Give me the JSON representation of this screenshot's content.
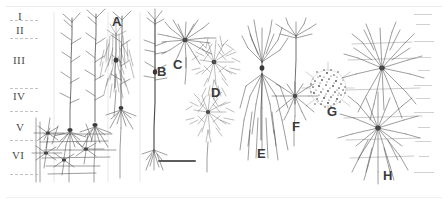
{
  "figure": {
    "background_color": "#ffffff",
    "ink_color": "#4d4d4d",
    "width": 448,
    "height": 205
  },
  "layers": {
    "axis_name": "cortical-layers",
    "items": [
      {
        "label": "I",
        "x": 18,
        "y": 16,
        "size": 11
      },
      {
        "label": "II",
        "x": 17,
        "y": 30,
        "size": 11
      },
      {
        "label": "III",
        "x": 14,
        "y": 60,
        "size": 11
      },
      {
        "label": "IV",
        "x": 14,
        "y": 96,
        "size": 11
      },
      {
        "label": "V",
        "x": 16,
        "y": 127,
        "size": 11
      },
      {
        "label": "VI",
        "x": 13,
        "y": 155,
        "size": 11
      }
    ],
    "boundaries": [
      {
        "y": 20,
        "x": 10,
        "width": 28
      },
      {
        "y": 38,
        "x": 10,
        "width": 28
      },
      {
        "y": 88,
        "x": 10,
        "width": 28
      },
      {
        "y": 111,
        "x": 10,
        "width": 28
      },
      {
        "y": 140,
        "x": 10,
        "width": 28
      },
      {
        "y": 174,
        "x": 10,
        "width": 28
      }
    ]
  },
  "panels": [
    {
      "id": "A",
      "label": "A",
      "x": 112,
      "y": 14,
      "size": 13,
      "description": "pyramidal cell with dense basal arbor"
    },
    {
      "id": "B",
      "label": "B",
      "x": 157,
      "y": 64,
      "size": 13,
      "description": "tall pyramidal cell with long descending axon"
    },
    {
      "id": "C",
      "label": "C",
      "x": 173,
      "y": 57,
      "size": 13,
      "description": "stellate / spiny cell"
    },
    {
      "id": "D",
      "label": "D",
      "x": 211,
      "y": 85,
      "size": 13,
      "description": "dense bushy interneuron"
    },
    {
      "id": "E",
      "label": "E",
      "x": 257,
      "y": 146,
      "size": 13,
      "description": "bitufted cell with long vertical processes"
    },
    {
      "id": "F",
      "label": "F",
      "x": 292,
      "y": 119,
      "size": 13,
      "description": "double bouquet cell"
    },
    {
      "id": "G",
      "label": "G",
      "x": 327,
      "y": 104,
      "size": 13,
      "description": "neurogliaform / dense spherical cell"
    },
    {
      "id": "H",
      "label": "H",
      "x": 383,
      "y": 168,
      "size": 13,
      "description": "paired multipolar basket cells"
    }
  ],
  "scale_bar": {
    "name": "scale-bar",
    "x": 158,
    "y": 160,
    "width": 38,
    "height": 2,
    "label": ""
  },
  "ruler_ticks": {
    "name": "right-margin-ticks",
    "x": 414,
    "items": [
      {
        "y": 14,
        "width": 18
      },
      {
        "y": 24,
        "width": 14
      },
      {
        "y": 41,
        "width": 20
      },
      {
        "y": 57,
        "width": 16
      },
      {
        "y": 70,
        "width": 12
      },
      {
        "y": 85,
        "width": 18
      },
      {
        "y": 98,
        "width": 14
      },
      {
        "y": 112,
        "width": 20
      },
      {
        "y": 127,
        "width": 12
      },
      {
        "y": 141,
        "width": 16
      },
      {
        "y": 156,
        "width": 10
      },
      {
        "y": 172,
        "width": 20
      }
    ]
  }
}
